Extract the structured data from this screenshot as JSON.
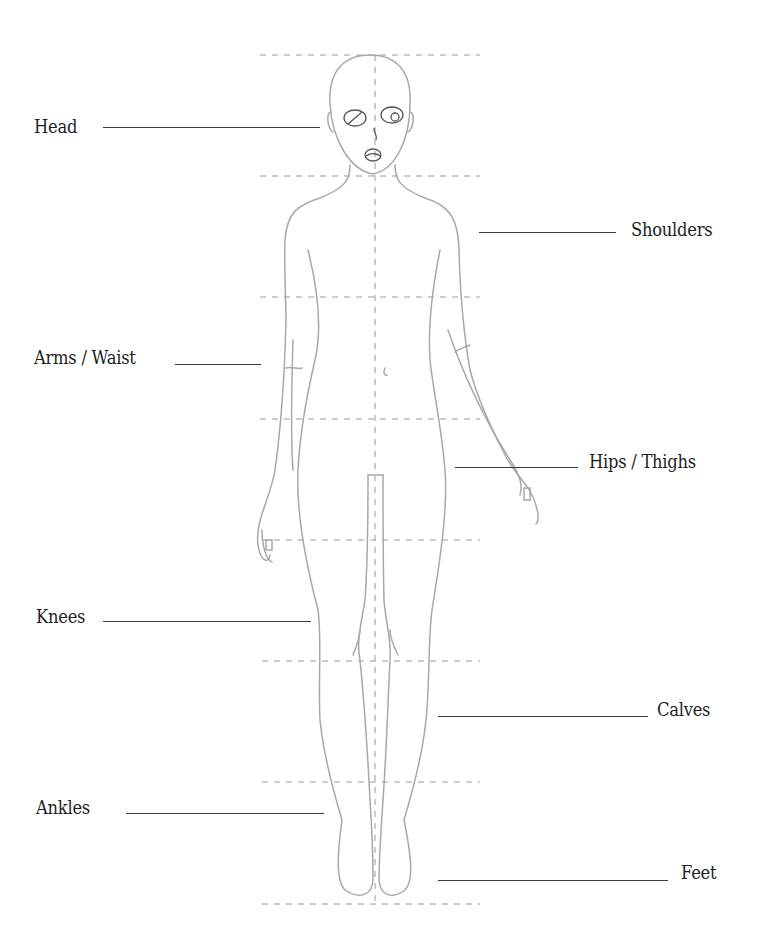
{
  "diagram": {
    "type": "body proportion figure",
    "colors": {
      "outline": "#a8a8a8",
      "guide": "#9a9a9a",
      "text": "#1e1e1e",
      "leader": "#3a3a3a"
    },
    "labels": [
      {
        "id": "head",
        "text": "Head"
      },
      {
        "id": "shoulders",
        "text": "Shoulders"
      },
      {
        "id": "arms-waist",
        "text": "Arms / Waist"
      },
      {
        "id": "hips-thighs",
        "text": "Hips / Thighs"
      },
      {
        "id": "knees",
        "text": "Knees"
      },
      {
        "id": "calves",
        "text": "Calves"
      },
      {
        "id": "ankles",
        "text": "Ankles"
      },
      {
        "id": "feet",
        "text": "Feet"
      }
    ]
  }
}
